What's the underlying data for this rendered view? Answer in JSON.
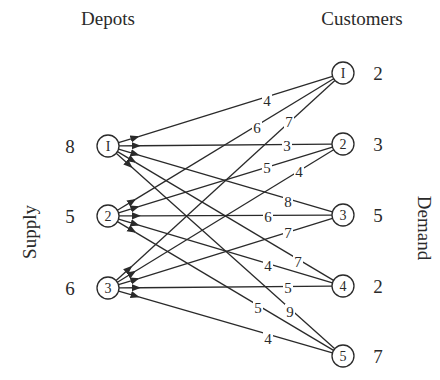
{
  "titles": {
    "depots": "Depots",
    "customers": "Customers",
    "supply": "Supply",
    "demand": "Demand"
  },
  "depots": [
    {
      "id": "1",
      "label": "I",
      "supply": "8",
      "x": 108,
      "y": 146
    },
    {
      "id": "2",
      "label": "2",
      "supply": "5",
      "x": 108,
      "y": 216
    },
    {
      "id": "3",
      "label": "3",
      "supply": "6",
      "x": 108,
      "y": 288
    }
  ],
  "customers": [
    {
      "id": "1",
      "label": "I",
      "demand": "2",
      "x": 343,
      "y": 73
    },
    {
      "id": "2",
      "label": "2",
      "demand": "3",
      "x": 343,
      "y": 144
    },
    {
      "id": "3",
      "label": "3",
      "demand": "5",
      "x": 343,
      "y": 215
    },
    {
      "id": "4",
      "label": "4",
      "demand": "2",
      "x": 343,
      "y": 286
    },
    {
      "id": "5",
      "label": "5",
      "demand": "7",
      "x": 343,
      "y": 356
    }
  ],
  "edges": [
    {
      "from": 1,
      "to": 1,
      "cost": "4",
      "lx": 267,
      "ly": 101
    },
    {
      "from": 1,
      "to": 2,
      "cost": "3",
      "lx": 287,
      "ly": 146
    },
    {
      "from": 1,
      "to": 3,
      "cost": "8",
      "lx": 288,
      "ly": 202
    },
    {
      "from": 1,
      "to": 4,
      "cost": "7",
      "lx": 298,
      "ly": 262
    },
    {
      "from": 1,
      "to": 5,
      "cost": "9",
      "lx": 290,
      "ly": 312
    },
    {
      "from": 2,
      "to": 1,
      "cost": "6",
      "lx": 257,
      "ly": 128
    },
    {
      "from": 2,
      "to": 2,
      "cost": "5",
      "lx": 267,
      "ly": 168
    },
    {
      "from": 2,
      "to": 3,
      "cost": "6",
      "lx": 268,
      "ly": 217
    },
    {
      "from": 2,
      "to": 4,
      "cost": "4",
      "lx": 268,
      "ly": 266
    },
    {
      "from": 2,
      "to": 5,
      "cost": "5",
      "lx": 258,
      "ly": 308
    },
    {
      "from": 3,
      "to": 1,
      "cost": "7",
      "lx": 289,
      "ly": 122
    },
    {
      "from": 3,
      "to": 2,
      "cost": "4",
      "lx": 299,
      "ly": 172
    },
    {
      "from": 3,
      "to": 3,
      "cost": "7",
      "lx": 288,
      "ly": 233
    },
    {
      "from": 3,
      "to": 4,
      "cost": "5",
      "lx": 288,
      "ly": 288
    },
    {
      "from": 3,
      "to": 5,
      "cost": "4",
      "lx": 268,
      "ly": 339
    }
  ],
  "style": {
    "ink": "#2a2a2a",
    "background": "#ffffff",
    "node_radius": 11
  }
}
